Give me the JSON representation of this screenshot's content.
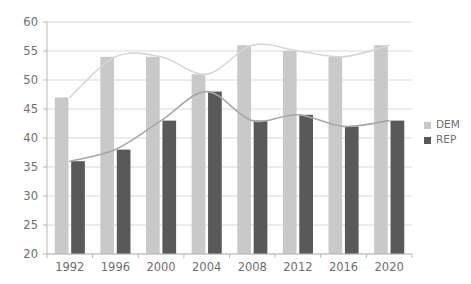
{
  "chart_data": {
    "type": "bar",
    "title": "",
    "xlabel": "",
    "ylabel": "",
    "categories": [
      "1992",
      "1996",
      "2000",
      "2004",
      "2008",
      "2012",
      "2016",
      "2020"
    ],
    "series": [
      {
        "name": "DEM",
        "color": "#c9c9c9",
        "values": [
          47,
          54,
          54,
          51,
          56,
          55,
          54,
          56
        ]
      },
      {
        "name": "REP",
        "color": "#595959",
        "values": [
          36,
          38,
          43,
          48,
          43,
          44,
          42,
          43
        ]
      }
    ],
    "ylim": [
      20,
      60
    ],
    "yticks": [
      20,
      25,
      30,
      35,
      40,
      45,
      50,
      55,
      60
    ],
    "ytick_labels": [
      "20",
      "25",
      "30",
      "35",
      "40",
      "45",
      "50",
      "55",
      "60"
    ],
    "grid": true,
    "legend_position": "right",
    "legend": [
      {
        "label": "DEM",
        "color": "#c9c9c9"
      },
      {
        "label": "REP",
        "color": "#595959"
      }
    ],
    "overlays": [
      {
        "name": "DEM trend",
        "color": "#d7d7d7",
        "smoothed_values": [
          47,
          54,
          54,
          51,
          56,
          55,
          54,
          56
        ]
      },
      {
        "name": "REP trend",
        "color": "#a8a8a8",
        "smoothed_values": [
          36,
          38,
          43,
          48,
          43,
          44,
          42,
          43
        ]
      }
    ]
  },
  "colors": {
    "dem": "#c9c9c9",
    "rep": "#595959",
    "grid": "#cfcfcf",
    "axis": "#b9b9b9",
    "text": "#6f6f6f",
    "background": "#ffffff"
  }
}
